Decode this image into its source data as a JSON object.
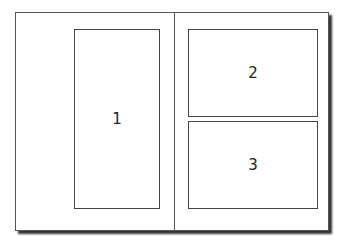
{
  "diagram": {
    "panels": [
      {
        "label": "1"
      },
      {
        "label": "2"
      },
      {
        "label": "3"
      }
    ]
  }
}
